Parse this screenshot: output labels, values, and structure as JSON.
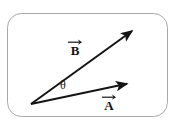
{
  "figure": {
    "type": "vector-diagram",
    "background_color": "#ffffff",
    "ink_color": "#141414",
    "border_color": "#a8a8a8",
    "width": 180,
    "height": 126
  },
  "frame": {
    "name": "rounded-rectangle-border",
    "x": 7,
    "y": 13,
    "width": 161,
    "height": 104,
    "corner_radius": 14,
    "stroke_width": 1,
    "color": "#a8a8a8"
  },
  "origin": {
    "label": "common-origin",
    "x": 31,
    "y": 104
  },
  "vectors": [
    {
      "id": "A",
      "label": "A",
      "accent": "arrow-overline",
      "from": [
        31,
        104
      ],
      "to": [
        131,
        83
      ],
      "stroke_width": 2,
      "color": "#141414",
      "arrowhead": "filled-triangle",
      "label_position": [
        108,
        103
      ]
    },
    {
      "id": "B",
      "label": "B",
      "accent": "arrow-overline",
      "from": [
        31,
        104
      ],
      "to": [
        136,
        28
      ],
      "stroke_width": 2,
      "color": "#141414",
      "arrowhead": "filled-triangle",
      "label_position": [
        74,
        48
      ]
    }
  ],
  "angle": {
    "id": "theta",
    "symbol": "θ",
    "description": "angle between vector A and vector B at the common origin",
    "position": [
      66,
      87
    ]
  }
}
